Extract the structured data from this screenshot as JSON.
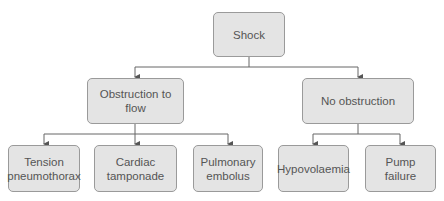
{
  "diagram": {
    "root": {
      "label": "Shock"
    },
    "level1": [
      {
        "label": "Obstruction to\nflow"
      },
      {
        "label": "No obstruction"
      }
    ],
    "level2": [
      {
        "label": "Tension\npneumothorax",
        "parent": "Obstruction to flow"
      },
      {
        "label": "Cardiac\ntamponade",
        "parent": "Obstruction to flow"
      },
      {
        "label": "Pulmonary\nembolus",
        "parent": "Obstruction to flow"
      },
      {
        "label": "Hypovolaemia",
        "parent": "No obstruction"
      },
      {
        "label": "Pump\nfailure",
        "parent": "No obstruction"
      }
    ],
    "colors": {
      "box_fill": "#e4e4e4",
      "box_border": "#9a9a9a",
      "line": "#555555",
      "text": "#555555"
    }
  }
}
